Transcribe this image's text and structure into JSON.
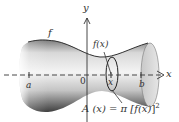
{
  "figure": {
    "type": "solid-of-revolution",
    "labels": {
      "y_axis": "y",
      "x_axis": "x",
      "a": "a",
      "origin": "0",
      "x_point": "x",
      "b": "b",
      "curve": "f",
      "radius": "f(x)",
      "formula_lhs": "A (x) = π [",
      "formula_fx": "f(x)",
      "formula_rhs": "]",
      "formula_exp": "2"
    },
    "colors": {
      "ink": "#333333",
      "solid_light": "#f2f2f2",
      "solid_mid": "#bdbdbd",
      "solid_dark": "#555555",
      "cap": "#d9d9d9"
    }
  }
}
